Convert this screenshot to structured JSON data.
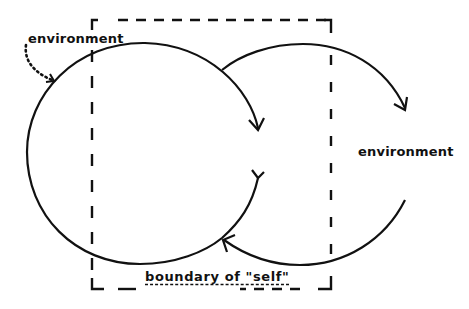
{
  "diagram": {
    "labels": {
      "environment_left": "environment",
      "environment_right": "environment",
      "boundary": "boundary of \"self\""
    },
    "colors": {
      "stroke": "#111111",
      "background": "#ffffff"
    },
    "elements": [
      {
        "id": "boundary-box",
        "shape": "dashed-rectangle",
        "label": "boundary of \"self\""
      },
      {
        "id": "left-loop",
        "shape": "circular-arrow",
        "direction": "clockwise",
        "description": "loop inside self boundary"
      },
      {
        "id": "right-loop",
        "shape": "circular-arc-arrows",
        "description": "loop crossing into environment"
      },
      {
        "id": "env-input-arrow",
        "shape": "dotted-curved-arrow",
        "from": "environment",
        "to": "left-loop"
      }
    ]
  }
}
